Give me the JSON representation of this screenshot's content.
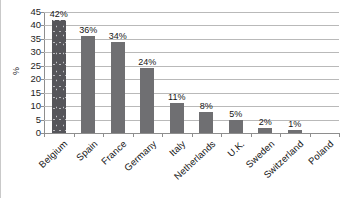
{
  "chart_data": {
    "type": "bar",
    "title": "",
    "subtitle": "",
    "xlabel": "",
    "ylabel": "%",
    "ylim": [
      0,
      45
    ],
    "ytick_step": 5,
    "yticks": [
      "45",
      "40",
      "35",
      "30",
      "25",
      "20",
      "15",
      "10",
      "5",
      "0"
    ],
    "grid": true,
    "legend": "none",
    "categories": [
      "Belgium",
      "Spain",
      "France",
      "Germany",
      "Italy",
      "Netherlands",
      "U.K.",
      "Sweden",
      "Switzerland",
      "Poland"
    ],
    "values": [
      42,
      36,
      34,
      24,
      11,
      8,
      5,
      2,
      1,
      0
    ],
    "data_labels": [
      "42%",
      "36%",
      "34%",
      "24%",
      "11%",
      "8%",
      "5%",
      "2%",
      "1%",
      ""
    ],
    "bar_fills": [
      "textured-dark",
      "solid-gray",
      "solid-gray",
      "solid-gray",
      "solid-gray",
      "solid-gray",
      "solid-gray",
      "solid-gray",
      "solid-gray",
      "solid-gray"
    ]
  },
  "colors": {
    "bar_default": "#6f6f72",
    "bar_highlight": "#55555a",
    "gridline": "#b9b9b9",
    "axis_line": "#8e8e8e",
    "text": "#161616",
    "background": "#ffffff"
  }
}
